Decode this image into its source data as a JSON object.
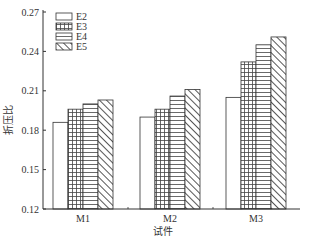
{
  "chart_data": {
    "type": "bar",
    "title": "",
    "xlabel": "试件",
    "ylabel": "折压比",
    "categories": [
      "M1",
      "M2",
      "M3"
    ],
    "series": [
      {
        "name": "E2",
        "pattern": "empty",
        "values": [
          0.186,
          0.19,
          0.205
        ]
      },
      {
        "name": "E3",
        "pattern": "grid",
        "values": [
          0.196,
          0.196,
          0.232
        ]
      },
      {
        "name": "E4",
        "pattern": "horizontal",
        "values": [
          0.2,
          0.206,
          0.245
        ]
      },
      {
        "name": "E5",
        "pattern": "diagonal",
        "values": [
          0.203,
          0.211,
          0.251
        ]
      }
    ],
    "ylim": [
      0.12,
      0.27
    ],
    "yticks": [
      "0.12",
      "0.15",
      "0.18",
      "0.21",
      "0.24",
      "0.27"
    ],
    "grid": false,
    "legend_position": "upper-left"
  }
}
